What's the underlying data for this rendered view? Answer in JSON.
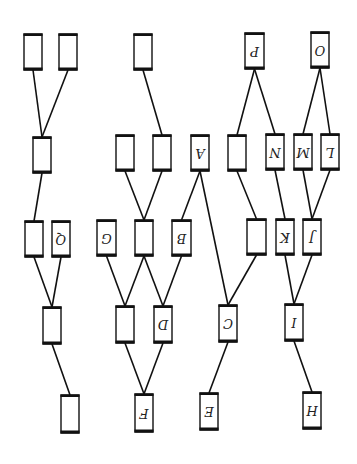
{
  "diagram": {
    "title": "",
    "orientation": "rotated-180",
    "nodes": [
      {
        "id": "n1",
        "label": "",
        "x": 24,
        "y": 34,
        "w": 18,
        "h": 36
      },
      {
        "id": "n2",
        "label": "",
        "x": 59,
        "y": 34,
        "w": 18,
        "h": 36
      },
      {
        "id": "n3",
        "label": "",
        "x": 134,
        "y": 34,
        "w": 18,
        "h": 36
      },
      {
        "id": "P",
        "label": "P",
        "x": 245,
        "y": 33,
        "w": 19,
        "h": 36
      },
      {
        "id": "O",
        "label": "O",
        "x": 311,
        "y": 32,
        "w": 18,
        "h": 36
      },
      {
        "id": "r2a",
        "label": "",
        "x": 33,
        "y": 137,
        "w": 18,
        "h": 36
      },
      {
        "id": "r2b",
        "label": "",
        "x": 116,
        "y": 135,
        "w": 18,
        "h": 36
      },
      {
        "id": "r2c",
        "label": "",
        "x": 153,
        "y": 135,
        "w": 18,
        "h": 36
      },
      {
        "id": "A",
        "label": "A",
        "x": 191,
        "y": 135,
        "w": 18,
        "h": 36
      },
      {
        "id": "r2d",
        "label": "",
        "x": 228,
        "y": 135,
        "w": 18,
        "h": 36
      },
      {
        "id": "N",
        "label": "N",
        "x": 266,
        "y": 134,
        "w": 18,
        "h": 36
      },
      {
        "id": "M",
        "label": "M",
        "x": 294,
        "y": 134,
        "w": 18,
        "h": 36
      },
      {
        "id": "L",
        "label": "L",
        "x": 321,
        "y": 134,
        "w": 18,
        "h": 36
      },
      {
        "id": "r3a",
        "label": "",
        "x": 25,
        "y": 221,
        "w": 18,
        "h": 36
      },
      {
        "id": "Q",
        "label": "Q",
        "x": 52,
        "y": 221,
        "w": 18,
        "h": 36
      },
      {
        "id": "G",
        "label": "G",
        "x": 97,
        "y": 220,
        "w": 19,
        "h": 36
      },
      {
        "id": "r3b",
        "label": "",
        "x": 135,
        "y": 220,
        "w": 18,
        "h": 36
      },
      {
        "id": "B",
        "label": "B",
        "x": 172,
        "y": 220,
        "w": 19,
        "h": 36
      },
      {
        "id": "r3c",
        "label": "",
        "x": 247,
        "y": 219,
        "w": 19,
        "h": 36
      },
      {
        "id": "K",
        "label": "K",
        "x": 276,
        "y": 219,
        "w": 18,
        "h": 36
      },
      {
        "id": "J",
        "label": "J",
        "x": 303,
        "y": 219,
        "w": 18,
        "h": 36
      },
      {
        "id": "r4a",
        "label": "",
        "x": 43,
        "y": 307,
        "w": 18,
        "h": 37
      },
      {
        "id": "r4b",
        "label": "",
        "x": 116,
        "y": 306,
        "w": 18,
        "h": 37
      },
      {
        "id": "D",
        "label": "D",
        "x": 154,
        "y": 306,
        "w": 18,
        "h": 37
      },
      {
        "id": "C",
        "label": "C",
        "x": 219,
        "y": 305,
        "w": 18,
        "h": 37
      },
      {
        "id": "I",
        "label": "I",
        "x": 285,
        "y": 304,
        "w": 18,
        "h": 37
      },
      {
        "id": "r5a",
        "label": "",
        "x": 61,
        "y": 395,
        "w": 18,
        "h": 38
      },
      {
        "id": "F",
        "label": "F",
        "x": 135,
        "y": 394,
        "w": 18,
        "h": 38
      },
      {
        "id": "E",
        "label": "E",
        "x": 200,
        "y": 393,
        "w": 18,
        "h": 37
      },
      {
        "id": "H",
        "label": "H",
        "x": 303,
        "y": 392,
        "w": 18,
        "h": 37
      }
    ],
    "edges": [
      [
        "n1",
        "r2a"
      ],
      [
        "n2",
        "r2a"
      ],
      [
        "n3",
        "r2c"
      ],
      [
        "P",
        "r2d"
      ],
      [
        "P",
        "N"
      ],
      [
        "O",
        "M"
      ],
      [
        "O",
        "L"
      ],
      [
        "r2a",
        "r3a"
      ],
      [
        "r2b",
        "r3b"
      ],
      [
        "r2c",
        "r3b"
      ],
      [
        "A",
        "B"
      ],
      [
        "A",
        "C"
      ],
      [
        "r2d",
        "r3c"
      ],
      [
        "N",
        "K"
      ],
      [
        "M",
        "J"
      ],
      [
        "L",
        "J"
      ],
      [
        "r3a",
        "r4a"
      ],
      [
        "Q",
        "r4a"
      ],
      [
        "G",
        "r4b"
      ],
      [
        "r3b",
        "r4b"
      ],
      [
        "r3b",
        "D"
      ],
      [
        "B",
        "D"
      ],
      [
        "r3c",
        "C"
      ],
      [
        "K",
        "I"
      ],
      [
        "J",
        "I"
      ],
      [
        "r4a",
        "r5a"
      ],
      [
        "r4b",
        "F"
      ],
      [
        "D",
        "F"
      ],
      [
        "C",
        "E"
      ],
      [
        "I",
        "H"
      ]
    ]
  }
}
